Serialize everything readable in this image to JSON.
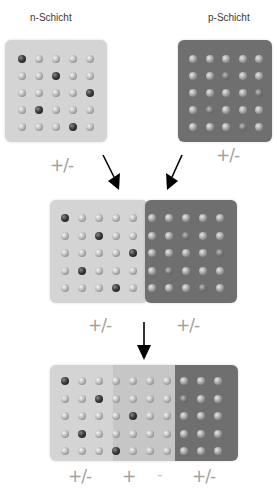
{
  "diagram": {
    "title_n": "n-Schicht",
    "title_p": "p-Schicht",
    "top": {
      "n_charge": "+/-",
      "p_charge": "+/-"
    },
    "middle": {
      "n_charge": "+/-",
      "p_charge": "+/-"
    },
    "bottom": {
      "n_charge": "+/-",
      "depletion_plus": "+",
      "depletion_minus": "-",
      "p_charge": "+/-"
    },
    "colors": {
      "n_layer": "#d4d4d4",
      "depletion_zone": "#c3c3c3",
      "p_layer": "#6f6f6f",
      "arrow": "#000000",
      "charge_text": "#a0a0a0"
    },
    "n_grid_dark_dots": [
      [
        0,
        0
      ],
      [
        1,
        2
      ],
      [
        2,
        4
      ],
      [
        3,
        1
      ],
      [
        4,
        3
      ]
    ],
    "grid_size": "5x5",
    "bottom_grid_columns": 10
  }
}
